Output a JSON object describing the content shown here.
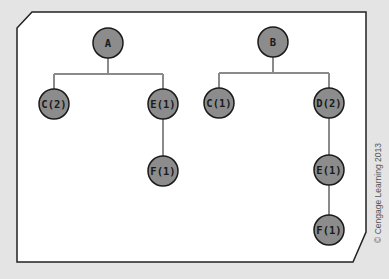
{
  "colors": {
    "background": "#e4e4e4",
    "panel_fill": "#ffffff",
    "panel_border": "#222222",
    "node_fill": "#8c8c8c",
    "node_border": "#1a1a1a",
    "edge": "#8a8a8a"
  },
  "trees": [
    {
      "root": {
        "id": "A",
        "label": "A"
      },
      "children": [
        {
          "id": "C2",
          "label": "C(2)",
          "children": []
        },
        {
          "id": "E1_left",
          "label": "E(1)",
          "children": [
            {
              "id": "F1_left",
              "label": "F(1)",
              "children": []
            }
          ]
        }
      ]
    },
    {
      "root": {
        "id": "B",
        "label": "B"
      },
      "children": [
        {
          "id": "C1",
          "label": "C(1)",
          "children": []
        },
        {
          "id": "D2",
          "label": "D(2)",
          "children": [
            {
              "id": "E1_right",
              "label": "E(1)",
              "children": [
                {
                  "id": "F1_right",
                  "label": "F(1)",
                  "children": []
                }
              ]
            }
          ]
        }
      ]
    }
  ],
  "labels": {
    "A": "A",
    "C2": "C(2)",
    "E1_left": "E(1)",
    "F1_left": "F(1)",
    "B": "B",
    "C1": "C(1)",
    "D2": "D(2)",
    "E1_right": "E(1)",
    "F1_right": "F(1)"
  },
  "credit": "© Cengage Learning 2013"
}
